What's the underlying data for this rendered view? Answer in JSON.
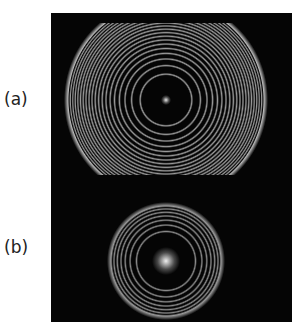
{
  "figure": {
    "background": "#ffffff",
    "panel_background": "#050505",
    "panels": [
      {
        "label": "(a)",
        "description": "dense concentric interference rings, outer rings clipped at top and bottom",
        "center": [
          115,
          77
        ],
        "outer_radius": 98,
        "ring_count": 20,
        "ring_color": "#9a9a9a",
        "outer_ring_color": "#b8b8b8",
        "center_spot_color": "#e6e6e6",
        "center_spot_radius": 5
      },
      {
        "label": "(b)",
        "description": "fewer concentric interference rings with bright central spot",
        "center": [
          115,
          86
        ],
        "outer_radius": 55,
        "ring_count": 7,
        "ring_color": "#8a8a8a",
        "outer_ring_color": "#9a9a9a",
        "center_spot_color": "#f0f0f0",
        "center_spot_radius": 14
      }
    ]
  }
}
